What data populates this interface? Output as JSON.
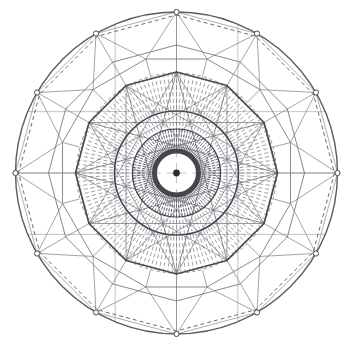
{
  "figure": {
    "kind": "radial-polygon-diagram",
    "background_color": "#ffffff",
    "canvas": {
      "width": 352,
      "height": 347
    },
    "center": {
      "x": 176.5,
      "y": 173.0
    },
    "symmetry_order": 12,
    "stroke_colors": {
      "outer_circle": "#5a5a60",
      "outer_dashed_polygon": "#6b6b72",
      "vertex_marker_stroke": "#4a4a52",
      "vertex_marker_fill": "#ffffff",
      "web_lines": "#8a8a92",
      "mid_polygon": "#7a7a82",
      "bold_dodecagon": "#4a4a52",
      "star_chords": "#6f6f77",
      "radial_dashes": "#77777f",
      "inner_rings": "#454550",
      "center_dot": "#2e2e36",
      "thin_grid": "#9a9aa2"
    },
    "rings": [
      {
        "name": "outer-circle",
        "radius": 161,
        "stroke_width": 1.4,
        "dashed": false
      },
      {
        "name": "outer-dashed-inscribed",
        "radius": 158,
        "stroke_width": 1.0,
        "dashed": true
      },
      {
        "name": "outer-vertex-ring",
        "radius": 161,
        "stroke_width": 1.0,
        "dashed": false
      },
      {
        "name": "second-ring",
        "radius": 128,
        "stroke_width": 0.9,
        "dashed": false
      },
      {
        "name": "third-ring",
        "radius": 118,
        "stroke_width": 0.9,
        "dashed": false
      },
      {
        "name": "bold-dodecagon",
        "radius": 101,
        "stroke_width": 1.7,
        "dashed": false
      },
      {
        "name": "dash-field-outer",
        "radius": 100,
        "stroke_width": 0.8,
        "dashed": true
      },
      {
        "name": "inner-circle-outer",
        "radius": 62,
        "stroke_width": 1.6,
        "dashed": false
      },
      {
        "name": "inner-circle-mid",
        "radius": 44,
        "stroke_width": 1.2,
        "dashed": false
      },
      {
        "name": "inner-dark-ring",
        "radius": 22,
        "stroke_width": 5.0,
        "dashed": false
      },
      {
        "name": "inner-white-ring",
        "radius": 13,
        "stroke_width": 6.0,
        "dashed": false
      },
      {
        "name": "center-dot",
        "radius": 3.4,
        "stroke_width": 0.0,
        "dashed": false
      }
    ],
    "counts": {
      "outer_vertices": 12,
      "vertex_markers": 12,
      "bold_polygon_sides": 12,
      "star_chord_step": 5,
      "radial_dash_spokes": 144,
      "inner_dash_spokes": 96,
      "web_cells": 24
    },
    "labels": {
      "none_visible": ""
    }
  }
}
